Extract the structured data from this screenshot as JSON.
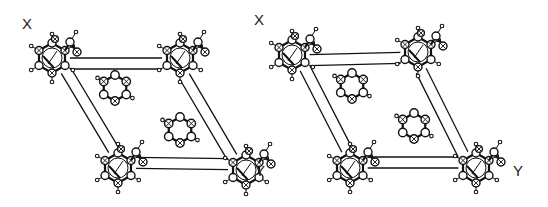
{
  "figure": {
    "type": "stereo-pair crystal packing diagram",
    "panels": [
      {
        "id": "left",
        "axis_labels": {
          "top_left": "X",
          "bottom_right": "Y"
        },
        "unit_cell_corners": [
          [
            52,
            58
          ],
          [
            180,
            58
          ],
          [
            246,
            170
          ],
          [
            118,
            168
          ]
        ],
        "corner_molecules": [
          [
            52,
            58
          ],
          [
            180,
            58
          ],
          [
            118,
            168
          ],
          [
            246,
            170
          ]
        ],
        "central_rings": [
          [
            115,
            88
          ],
          [
            180,
            130
          ]
        ]
      },
      {
        "id": "right",
        "axis_labels": {
          "top_left": "X",
          "bottom_right": "Y"
        },
        "unit_cell_corners": [
          [
            292,
            55
          ],
          [
            418,
            52
          ],
          [
            476,
            168
          ],
          [
            350,
            168
          ]
        ],
        "corner_molecules": [
          [
            292,
            55
          ],
          [
            418,
            52
          ],
          [
            350,
            168
          ],
          [
            476,
            168
          ]
        ],
        "central_rings": [
          [
            352,
            86
          ],
          [
            414,
            126
          ]
        ]
      }
    ],
    "colors": {
      "ink": "#111111",
      "background": "#ffffff"
    }
  }
}
